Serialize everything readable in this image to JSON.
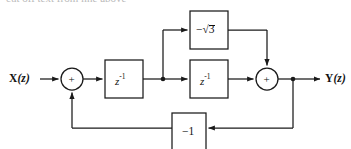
{
  "figure": {
    "kind": "signal-flow-block-diagram",
    "background_color": "#ffffff",
    "line_color": "#1a1a1a",
    "text_color": "#111111"
  },
  "top_remnant": {
    "text": "cut off text from line above"
  },
  "io": {
    "input": {
      "var": "X",
      "arg": "(z)",
      "full": "X(z)"
    },
    "output": {
      "var": "Y",
      "arg": "(z)",
      "full": "Y(z)"
    }
  },
  "adders": [
    {
      "id": "adder-input",
      "symbol": "+",
      "cx": 72,
      "cy": 79,
      "r": 11
    },
    {
      "id": "adder-output",
      "symbol": "+",
      "cx": 267,
      "cy": 79,
      "r": 11
    }
  ],
  "blocks": [
    {
      "id": "delay-1",
      "label": "z",
      "exponent": "-1",
      "full": "z^-1",
      "x": 105,
      "y": 60,
      "w": 38,
      "h": 38
    },
    {
      "id": "delay-2",
      "label": "z",
      "exponent": "-1",
      "full": "z^-1",
      "x": 190,
      "y": 60,
      "w": 38,
      "h": 38
    },
    {
      "id": "gain-sqrt3",
      "label": "−√3",
      "minus": "−",
      "radical": "√",
      "radicand": "3",
      "x": 190,
      "y": 11,
      "w": 38,
      "h": 38
    },
    {
      "id": "gain-minus-one",
      "label": "−1",
      "x": 172,
      "y": 113,
      "w": 34,
      "h": 36
    }
  ],
  "nodes": [
    {
      "id": "branch-after-delay1",
      "x": 163,
      "y": 79
    },
    {
      "id": "branch-output",
      "x": 293,
      "y": 79
    }
  ],
  "signal_path": {
    "main_line_y": 79,
    "feedback_line_y": 128,
    "top_line_y": 30,
    "input_x": 40,
    "output_x": 322
  }
}
